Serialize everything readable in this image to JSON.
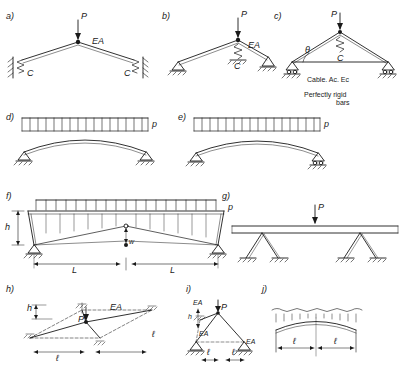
{
  "figure": {
    "background": "#ffffff",
    "line_color": "#1a1a1a"
  },
  "panels": [
    {
      "id": "a",
      "label": "a)",
      "load_label": "P",
      "member_labels": [
        "EA"
      ],
      "support_labels": [
        "C",
        "C"
      ],
      "description": "Two-bar triangular frame with elastic (spring) supports at both ends, point load P at apex"
    },
    {
      "id": "b",
      "label": "b)",
      "load_label": "P",
      "member_labels": [
        "EA"
      ],
      "support_labels": [
        "C"
      ],
      "description": "Asymmetric two-bar frame with spring C under apex, point load P"
    },
    {
      "id": "c",
      "label": "c)",
      "load_label": "P",
      "support_labels": [
        "C"
      ],
      "angle_label": "θ",
      "notes": [
        "Cable. Ac. Ec",
        "Perfectly   rigid",
        "bars"
      ],
      "description": "Cable-stayed triangular scheme with perfectly rigid bars and a cable of area Ac, modulus Ec"
    },
    {
      "id": "d",
      "label": "d)",
      "load_label": "p",
      "description": "Shallow two-hinged arch under uniformly distributed load p"
    },
    {
      "id": "e",
      "label": "e)",
      "load_label": "p",
      "description": "Shallow arch with roller at right under uniformly distributed load p"
    },
    {
      "id": "f",
      "label": "f)",
      "load_label": "p",
      "dim_labels": [
        "h",
        "L",
        "L",
        "w"
      ],
      "description": "Portal/trussed frame with central hinge, distributed load p on top chord, height h and spans L, L, central deflection w"
    },
    {
      "id": "g",
      "label": "g)",
      "load_label": "P",
      "description": "Girder on inclined V-shaped legs with point load P at midspan"
    },
    {
      "id": "h",
      "label": "h)",
      "load_label": "P",
      "member_labels": [
        "EA"
      ],
      "dim_labels": [
        "h",
        "ℓ",
        "ℓ"
      ],
      "description": "Space/plan truss pyramid with axial stiffness EA, height h, plan dimensions ℓ and ℓ, load P"
    },
    {
      "id": "i",
      "label": "i)",
      "load_label": "P",
      "member_labels": [
        "EA",
        "EA",
        "EA"
      ],
      "dim_labels": [
        "h",
        "ℓ",
        "ℓ"
      ],
      "description": "Three-bar pin-jointed assembly, bars of stiffness EA, height h, bay lengths ℓ"
    },
    {
      "id": "j",
      "label": "j)",
      "dim_labels": [
        "ℓ",
        "ℓ"
      ],
      "description": "Shallow arch under hydrostatic/linearly varying load with spans ℓ and ℓ"
    }
  ]
}
